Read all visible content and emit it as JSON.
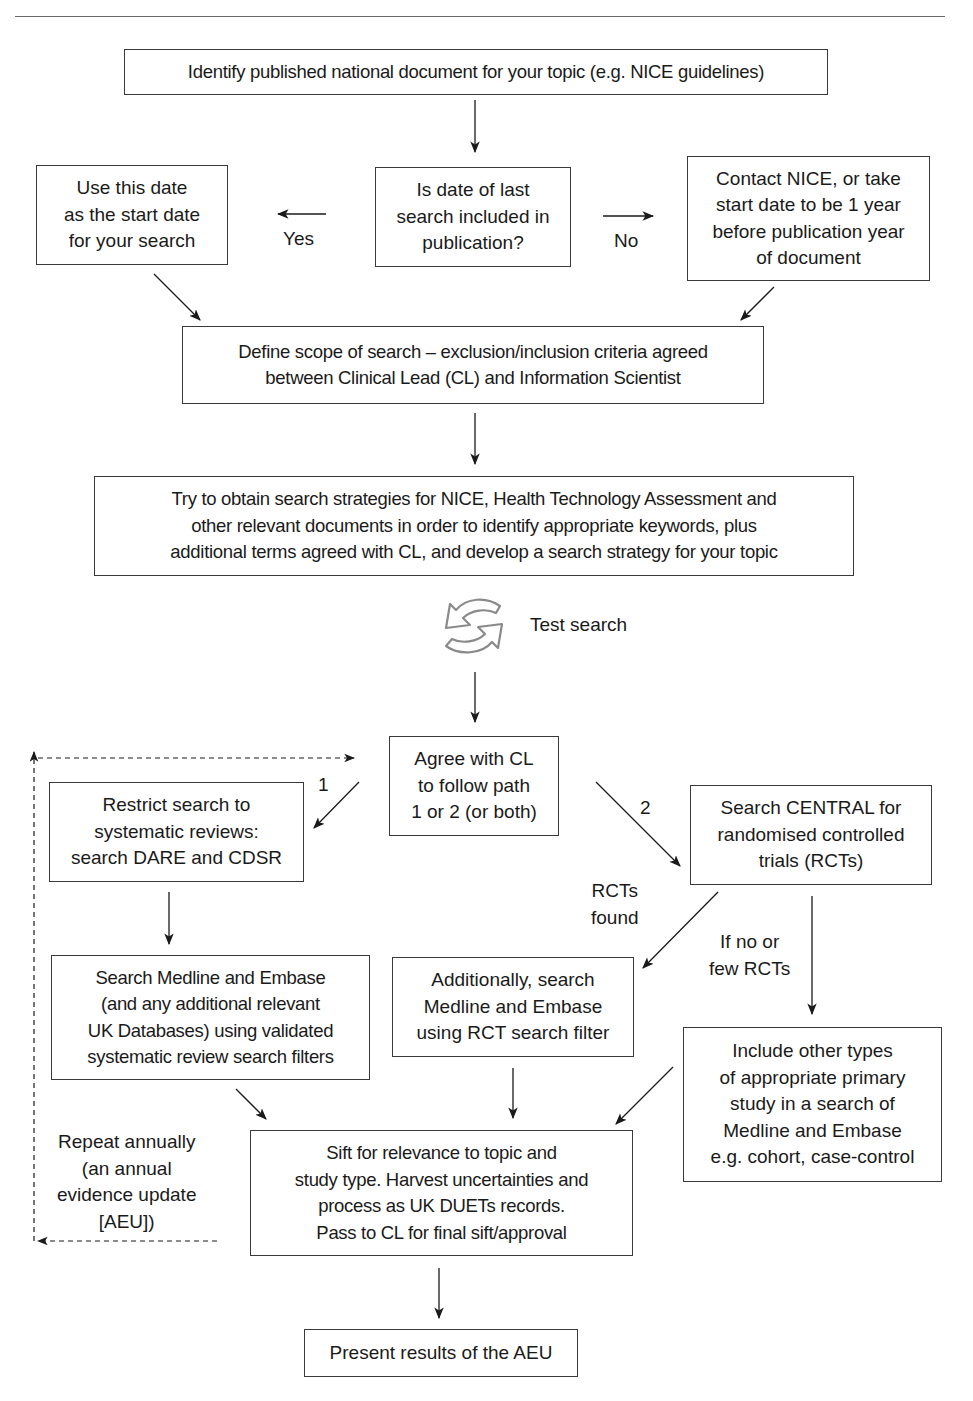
{
  "header": {
    "running_title": "HANDBOOK OF UNCERTAINTY IN HEALTHCARE"
  },
  "flowchart": {
    "title": "AEU search process flowchart",
    "nodes": {
      "identify": "Identify published national document for your topic (e.g. NICE guidelines)",
      "use_date": "Use this date\nas the start date\nfor your search",
      "is_date": "Is date of last\nsearch included in\npublication?",
      "contact_nice": "Contact NICE, or take\nstart date to be 1 year\nbefore publication year\nof document",
      "define_scope": "Define scope of search – exclusion/inclusion criteria agreed\nbetween Clinical Lead (CL) and Information Scientist",
      "obtain_strategies": "Try to obtain search strategies for NICE, Health Technology Assessment and\nother relevant documents in order to identify appropriate keywords, plus\nadditional terms agreed with CL, and develop a search strategy for your topic",
      "agree_cl": "Agree with CL\nto follow path\n1 or 2 (or both)",
      "restrict_search": "Restrict search to\nsystematic reviews:\nsearch DARE and CDSR",
      "search_central": "Search CENTRAL for\nrandomised controlled\ntrials (RCTs)",
      "search_medline_sr": "Search Medline and Embase\n(and any additional relevant\nUK Databases) using validated\nsystematic review search filters",
      "additionally_search": "Additionally, search\nMedline and Embase\nusing RCT search filter",
      "include_other": "Include other types\nof appropriate primary\nstudy in a search of\nMedline and Embase\ne.g. cohort, case-control",
      "sift": "Sift for relevance to topic and\nstudy type. Harvest uncertainties and\nprocess as UK DUETs records.\nPass to CL for final sift/approval",
      "present": "Present results of the AEU"
    },
    "edge_labels": {
      "yes": "Yes",
      "no": "No",
      "path_1": "1",
      "path_2": "2",
      "rcts_found": "RCTs\nfound",
      "no_few_rcts": "If no or\nfew RCTs",
      "repeat_annually": "Repeat annually\n(an annual\nevidence update\n[AEU])"
    },
    "icon_labels": {
      "test_search": "Test search"
    },
    "colors": {
      "line": "#1a1a1a",
      "box_border": "#3a3a3a",
      "icon_gray": "#8a8a8a"
    }
  }
}
